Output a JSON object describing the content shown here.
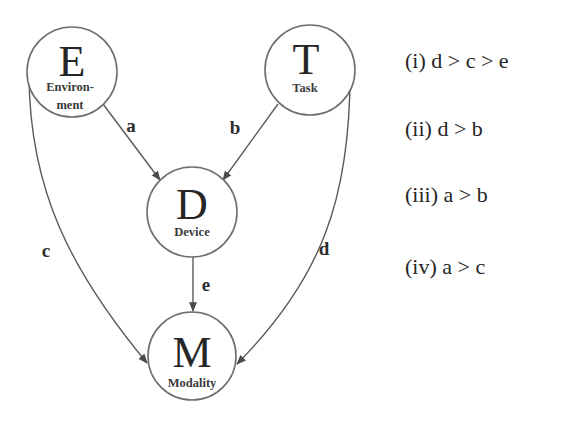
{
  "diagram": {
    "title": "",
    "nodes": [
      {
        "id": "E",
        "letter": "E",
        "label_line1": "Environ-",
        "label_line2": "ment",
        "full_label": "Environment",
        "cx": 72,
        "cy": 72,
        "r": 45
      },
      {
        "id": "T",
        "letter": "T",
        "label_line1": "Task",
        "label_line2": "",
        "full_label": "Task",
        "cx": 310,
        "cy": 70,
        "r": 45
      },
      {
        "id": "D",
        "letter": "D",
        "label_line1": "Device",
        "label_line2": "",
        "full_label": "Device",
        "cx": 192,
        "cy": 212,
        "r": 45
      },
      {
        "id": "M",
        "letter": "M",
        "label_line1": "Modality",
        "label_line2": "",
        "full_label": "Modality",
        "cx": 192,
        "cy": 356,
        "r": 44
      }
    ],
    "edges": [
      {
        "id": "a",
        "label": "a",
        "from": "E",
        "to": "D",
        "shape": "straight"
      },
      {
        "id": "b",
        "label": "b",
        "from": "T",
        "to": "D",
        "shape": "straight"
      },
      {
        "id": "c",
        "label": "c",
        "from": "E",
        "to": "M",
        "shape": "curved-left"
      },
      {
        "id": "d",
        "label": "d",
        "from": "T",
        "to": "M",
        "shape": "curved-right"
      },
      {
        "id": "e",
        "label": "e",
        "from": "D",
        "to": "M",
        "shape": "straight"
      }
    ],
    "hypotheses": [
      {
        "id": "i",
        "text": "(i) d > c > e"
      },
      {
        "id": "ii",
        "text": "(ii) d > b"
      },
      {
        "id": "iii",
        "text": "(iii) a > b"
      },
      {
        "id": "iv",
        "text": "(iv) a > c"
      }
    ],
    "colors": {
      "background": "#ffffff",
      "stroke": "#6e6e6e",
      "text": "#262626"
    }
  }
}
